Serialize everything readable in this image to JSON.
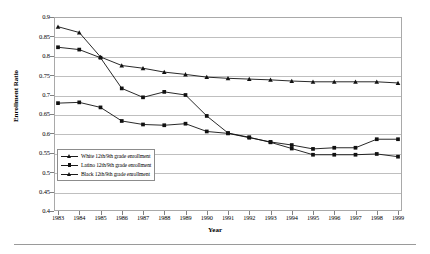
{
  "chart_data": {
    "type": "line",
    "title": "",
    "xlabel": "Year",
    "ylabel": "Enrollment Ratio",
    "x": [
      1983,
      1984,
      1985,
      1986,
      1987,
      1988,
      1989,
      1990,
      1991,
      1992,
      1993,
      1994,
      1995,
      1996,
      1997,
      1998,
      1999
    ],
    "xtick_labels": [
      "1983",
      "1984",
      "1985",
      "1986",
      "1987",
      "1988",
      "1989",
      "1990",
      "1991",
      "1992",
      "1993",
      "1994",
      "1995",
      "1996",
      "1997",
      "1998",
      "1999"
    ],
    "ytick_labels": [
      "0.4",
      "0.45",
      "0.5",
      "0.55",
      "0.6",
      "0.65",
      "0.7",
      "0.75",
      "0.8",
      "0.85",
      "0.9"
    ],
    "ytick_values": [
      0.4,
      0.45,
      0.5,
      0.55,
      0.6,
      0.65,
      0.7,
      0.75,
      0.8,
      0.85,
      0.9
    ],
    "ylim": [
      0.4,
      0.9
    ],
    "xlim": [
      1983,
      1999
    ],
    "grid": "horizontal",
    "legend_position": "inside-lower-left",
    "series": [
      {
        "name": "White 12th/9th grade enrollment",
        "marker": "triangle",
        "color": "#111111",
        "values": [
          0.875,
          0.86,
          0.797,
          0.775,
          0.768,
          0.758,
          0.752,
          0.745,
          0.742,
          0.74,
          0.738,
          0.735,
          0.733,
          0.733,
          0.733,
          0.733,
          0.73
        ]
      },
      {
        "name": "Latino 12th/9th grade enrollment",
        "marker": "square",
        "color": "#111111",
        "values": [
          0.822,
          0.816,
          0.795,
          0.716,
          0.693,
          0.707,
          0.699,
          0.645,
          0.601,
          0.59,
          0.577,
          0.561,
          0.545,
          0.545,
          0.545,
          0.547,
          0.54
        ]
      },
      {
        "name": "Black 12th/9th grade enrollment",
        "marker": "square",
        "color": "#111111",
        "values": [
          0.678,
          0.68,
          0.667,
          0.632,
          0.623,
          0.621,
          0.625,
          0.605,
          0.6,
          0.589,
          0.578,
          0.57,
          0.56,
          0.563,
          0.563,
          0.585,
          0.585
        ]
      }
    ]
  },
  "legend": {
    "items": [
      {
        "label": "White 12th/9th grade enrollment",
        "marker": "triangle"
      },
      {
        "label": "Latino 12th/9th grade enrollment",
        "marker": "square"
      },
      {
        "label": "Black 12th/9th grade enrollment",
        "marker": "triangle"
      }
    ]
  }
}
